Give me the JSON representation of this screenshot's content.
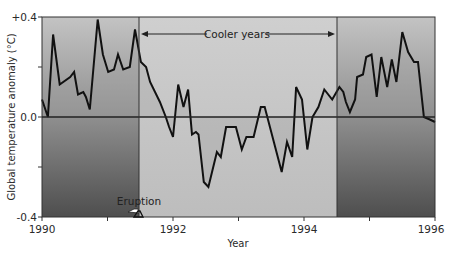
{
  "chart_data": {
    "type": "line",
    "title": "",
    "xlabel": "Year",
    "ylabel": "Global temperature anomaly (°C)",
    "xlim": [
      1990,
      1996
    ],
    "ylim": [
      -0.4,
      0.4
    ],
    "x_ticks": [
      1990,
      1991,
      1992,
      1993,
      1994,
      1995,
      1996
    ],
    "x_tick_labels": [
      "1990",
      "",
      "1992",
      "",
      "1994",
      "",
      "1996"
    ],
    "y_ticks": [
      0.4,
      0.2,
      0.0,
      -0.2,
      -0.4
    ],
    "y_tick_labels": [
      "+0.4",
      "",
      "0.0",
      "",
      "-0.4"
    ],
    "grid": false,
    "legend": null,
    "series": [
      {
        "name": "Global temperature anomaly",
        "color": "#111111",
        "x": [
          1990.0,
          1990.09,
          1990.17,
          1990.27,
          1990.43,
          1990.49,
          1990.55,
          1990.63,
          1990.67,
          1990.73,
          1990.85,
          1990.93,
          1991.01,
          1991.1,
          1991.16,
          1991.24,
          1991.34,
          1991.42,
          1991.51,
          1991.59,
          1991.65,
          1991.8,
          1991.89,
          1991.94,
          1992.0,
          1992.08,
          1992.16,
          1992.23,
          1992.29,
          1992.35,
          1992.39,
          1992.47,
          1992.54,
          1992.67,
          1992.73,
          1992.81,
          1992.96,
          1993.05,
          1993.12,
          1993.23,
          1993.34,
          1993.4,
          1993.53,
          1993.66,
          1993.74,
          1993.82,
          1993.88,
          1993.97,
          1994.05,
          1994.13,
          1994.22,
          1994.31,
          1994.43,
          1994.54,
          1994.6,
          1994.64,
          1994.7,
          1994.78,
          1994.81,
          1994.9,
          1994.95,
          1995.03,
          1995.11,
          1995.18,
          1995.27,
          1995.34,
          1995.41,
          1995.5,
          1995.59,
          1995.68,
          1995.74,
          1995.83,
          1995.92,
          1996.0
        ],
        "values": [
          0.07,
          0.0,
          0.33,
          0.13,
          0.16,
          0.18,
          0.09,
          0.1,
          0.08,
          0.03,
          0.39,
          0.25,
          0.18,
          0.19,
          0.25,
          0.19,
          0.2,
          0.35,
          0.22,
          0.2,
          0.14,
          0.06,
          0.0,
          -0.04,
          -0.08,
          0.13,
          0.04,
          0.11,
          -0.07,
          -0.06,
          -0.07,
          -0.26,
          -0.28,
          -0.14,
          -0.16,
          -0.04,
          -0.04,
          -0.13,
          -0.08,
          -0.08,
          0.04,
          0.04,
          -0.09,
          -0.22,
          -0.1,
          -0.16,
          0.12,
          0.07,
          -0.13,
          0.0,
          0.04,
          0.11,
          0.07,
          0.12,
          0.1,
          0.06,
          0.02,
          0.07,
          0.16,
          0.17,
          0.24,
          0.25,
          0.08,
          0.24,
          0.12,
          0.23,
          0.14,
          0.34,
          0.26,
          0.22,
          0.22,
          0.0,
          -0.01,
          -0.02
        ]
      }
    ],
    "regions": [
      {
        "name": "pre-eruption",
        "x": [
          1990,
          1991.48
        ],
        "shading": "gradient-dark"
      },
      {
        "name": "cooler-years",
        "x": [
          1991.48,
          1994.5
        ],
        "shading": "light-gray"
      },
      {
        "name": "post",
        "x": [
          1994.5,
          1996
        ],
        "shading": "gradient-dark"
      }
    ],
    "annotations": [
      {
        "text": "Cooler years",
        "type": "double-arrow",
        "x_from": 1991.48,
        "x_to": 1994.5,
        "y": 0.37
      },
      {
        "text": "Eruption",
        "type": "marker",
        "x": 1991.46,
        "y": -0.4
      }
    ]
  },
  "labels": {
    "ylabel": "Global temperature anomaly (°C)",
    "xlabel": "Year",
    "y_top": "+0.4",
    "y_zero": "0.0",
    "y_bottom": "-0.4",
    "x_1990": "1990",
    "x_1992": "1992",
    "x_1994": "1994",
    "x_1996": "1996",
    "cooler_years": "Cooler years",
    "eruption": "Eruption"
  },
  "colors": {
    "line": "#111111",
    "frame": "#333333",
    "light_region": "#c4c4c4",
    "gradient_top": "#bdbdbd",
    "gradient_bottom": "#545454"
  }
}
